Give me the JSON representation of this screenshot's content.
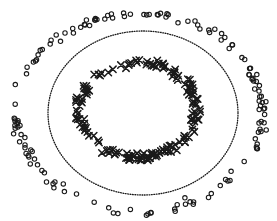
{
  "chart_data": {
    "type": "scatter",
    "title": "",
    "xlabel": "",
    "ylabel": "",
    "grid": false,
    "axes_visible": false,
    "legend": null,
    "ink_color": "#1a1a1a",
    "background": "#ffffff",
    "series": [
      {
        "name": "outer-class",
        "marker": "o",
        "shape": "ring",
        "center": [
          139,
          112
        ],
        "rx": 124,
        "ry": 99,
        "radial_jitter": 7,
        "count": 150,
        "seed": 7,
        "marker_size": 2.2
      },
      {
        "name": "inner-class",
        "marker": "x",
        "shape": "ring",
        "center": [
          138,
          110
        ],
        "rx": 59,
        "ry": 47,
        "radial_jitter": 6,
        "count": 170,
        "seed": 13,
        "marker_size": 3.2
      }
    ],
    "decision_boundary": {
      "style": "dotted",
      "shape": "ellipse",
      "center": [
        143,
        113
      ],
      "rx": 95,
      "ry": 82
    }
  }
}
